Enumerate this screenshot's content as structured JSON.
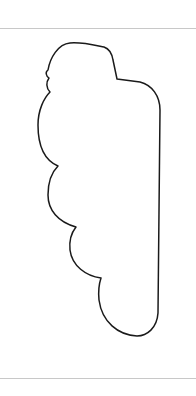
{
  "canvas": {
    "width": 196,
    "height": 396,
    "background": "#ffffff"
  },
  "dividers": {
    "color": "#c8c8c8",
    "top_y": 28,
    "bottom_y": 378
  },
  "shape": {
    "name": "cloud-outline",
    "stroke": "#1a1a1a",
    "stroke_width": 1.5,
    "fill": "none",
    "path": "M 70 43 C 82 42, 94 45, 104 47 C 110 49, 112 54, 113 60 L 117 79 L 140 82 C 152 85, 160 96, 160 110 L 158 313 C 157 328, 147 336, 137 336 C 118 335, 102 322, 99 300 C 98 290, 99 284, 101 278 C 86 276, 72 266, 70 250 C 69 240, 72 232, 76 227 C 58 222, 48 210, 48 195 C 48 183, 52 172, 58 166 C 44 160, 38 145, 38 125 C 38 110, 44 98, 50 92 C 46 88, 46 82, 49 78 C 46 76, 45 72, 48 70 C 50 58, 58 44, 70 43 Z"
  }
}
